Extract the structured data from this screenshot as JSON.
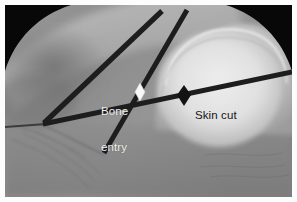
{
  "figure": {
    "type": "fluoroscopic-radiograph",
    "modality": "intraoperative fluoroscopy",
    "border_color": "#fdfdfd",
    "background_color": "#8e8e8e",
    "vignette_color": "#080808"
  },
  "annotations": {
    "bone_entry": {
      "label_line1": "Bone",
      "label_line2": "entry",
      "text_color": "#f2f2f2",
      "marker": "white-diamond",
      "marker_color": "#f7f7f7",
      "marker_x": 135,
      "marker_y": 86
    },
    "skin_cut": {
      "label": "Skin cut",
      "text_color": "#151515",
      "marker": "black-diamond",
      "marker_color": "#141414",
      "marker_x": 179,
      "marker_y": 90
    }
  },
  "instruments": [
    {
      "name": "guide-wire-upper-left",
      "color": "#1d1d1d",
      "width": 5.2,
      "x1": 40,
      "y1": 117,
      "x2": 156,
      "y2": 7
    },
    {
      "name": "guide-wire-upper-right",
      "color": "#1d1d1d",
      "width": 5.0,
      "x1": 99,
      "y1": 148,
      "x2": 181,
      "y2": 6
    },
    {
      "name": "guide-wire-horizontal",
      "color": "#1d1d1d",
      "width": 5.0,
      "x1": 40,
      "y1": 119,
      "x2": 287,
      "y2": 68
    },
    {
      "name": "needle-thin-left",
      "color": "#3a3a3a",
      "width": 2.0,
      "x1": 0,
      "y1": 122,
      "x2": 41,
      "y2": 119
    }
  ],
  "anatomy": {
    "features": [
      "femoral-head",
      "acetabulum",
      "pelvic-brim",
      "soft-tissue-shadow"
    ]
  }
}
